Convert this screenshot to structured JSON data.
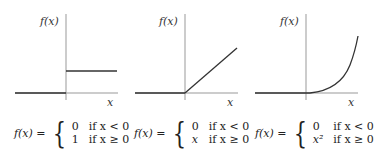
{
  "panels": [
    {
      "name": "step-function",
      "y_label": "f(x)",
      "x_label": "x",
      "formula": {
        "lhs": "f(x) =",
        "cases": [
          {
            "value": "0",
            "condition": "if x < 0"
          },
          {
            "value": "1",
            "condition": "if x ≥ 0"
          }
        ]
      }
    },
    {
      "name": "relu-linear",
      "y_label": "f(x)",
      "x_label": "x",
      "formula": {
        "lhs": "f(x) =",
        "cases": [
          {
            "value": "0",
            "condition": "if x < 0"
          },
          {
            "value": "x",
            "condition": "if x ≥ 0"
          }
        ]
      }
    },
    {
      "name": "relu-quadratic",
      "y_label": "f(x)",
      "x_label": "x",
      "formula": {
        "lhs": "f(x) =",
        "cases": [
          {
            "value": "0",
            "condition": "if x < 0"
          },
          {
            "value": "x²",
            "condition": "if x ≥ 0"
          }
        ]
      }
    }
  ],
  "colors": {
    "axis": "#999999",
    "curve": "#333333"
  }
}
